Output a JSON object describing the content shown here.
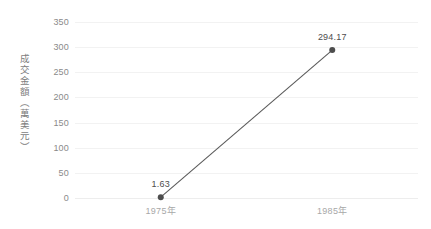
{
  "chart_data": {
    "type": "line",
    "title": "",
    "xlabel": "",
    "ylabel": "成交金額（萬美元）",
    "categories": [
      "1975年",
      "1985年"
    ],
    "values": [
      1.63,
      294.17
    ],
    "point_labels": [
      "1.63",
      "294.17"
    ],
    "ylim": [
      0,
      350
    ],
    "ytick_labels": [
      "350",
      "300",
      "250",
      "200",
      "150",
      "100",
      "50",
      "0"
    ],
    "ytick_values": [
      350,
      300,
      250,
      200,
      150,
      100,
      50,
      0
    ],
    "grid": "horizontal",
    "legend": "none",
    "series": [
      {
        "name": "成交金額",
        "values": [
          1.63,
          294.17
        ]
      }
    ],
    "colors": {
      "line": "#595959",
      "marker": "#4d4d4d",
      "gridline": "#f2f2f2",
      "ytick_text": "#8a8a8a",
      "xtick_text": "#a8a8a8",
      "label_text": "#4d4d4d",
      "axis_title_text": "#7d7d7d",
      "background": "#ffffff"
    }
  }
}
